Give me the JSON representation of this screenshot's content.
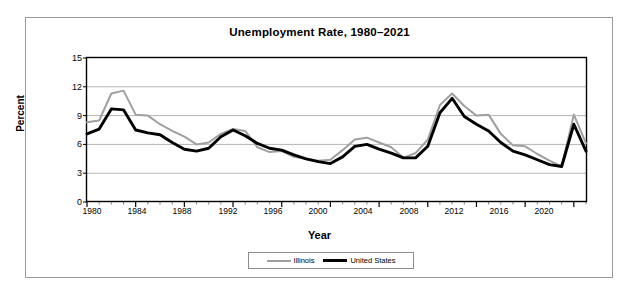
{
  "chart_data": {
    "type": "line",
    "title": "Unemployment Rate, 1980–2021",
    "xlabel": "Year",
    "ylabel": "Percent",
    "ylim": [
      0,
      15
    ],
    "xlim": [
      1980,
      2021
    ],
    "ytick_labels": [
      "15",
      "12",
      "9",
      "6",
      "3",
      "0"
    ],
    "yticks": [
      15,
      12,
      9,
      6,
      3,
      0
    ],
    "xtick_labels": [
      "1980",
      "1984",
      "1988",
      "1992",
      "1996",
      "2000",
      "2004",
      "2008",
      "2012",
      "2016",
      "2020"
    ],
    "xticks": [
      1980,
      1984,
      1988,
      1992,
      1996,
      2000,
      2004,
      2008,
      2012,
      2016,
      2020
    ],
    "grid": "horizontal",
    "legend_position": "bottom",
    "x": [
      1980,
      1981,
      1982,
      1983,
      1984,
      1985,
      1986,
      1987,
      1988,
      1989,
      1990,
      1991,
      1992,
      1993,
      1994,
      1995,
      1996,
      1997,
      1998,
      1999,
      2000,
      2001,
      2002,
      2003,
      2004,
      2005,
      2006,
      2007,
      2008,
      2009,
      2010,
      2011,
      2012,
      2013,
      2014,
      2015,
      2016,
      2017,
      2018,
      2019,
      2020,
      2021
    ],
    "series": [
      {
        "name": "Illinois",
        "color": "#a0a0a0",
        "line_width": 2,
        "values": [
          8.3,
          8.5,
          11.3,
          11.6,
          9.1,
          9.0,
          8.1,
          7.4,
          6.8,
          6.0,
          6.2,
          7.1,
          7.6,
          7.4,
          5.7,
          5.2,
          5.3,
          4.7,
          4.5,
          4.3,
          4.4,
          5.4,
          6.5,
          6.7,
          6.2,
          5.7,
          4.6,
          5.1,
          6.5,
          10.1,
          11.3,
          10.0,
          9.0,
          9.1,
          7.1,
          5.9,
          5.8,
          5.0,
          4.3,
          3.7,
          9.1,
          6.1
        ]
      },
      {
        "name": "United States",
        "color": "#000000",
        "line_width": 3,
        "values": [
          7.1,
          7.6,
          9.7,
          9.6,
          7.5,
          7.2,
          7.0,
          6.2,
          5.5,
          5.3,
          5.6,
          6.8,
          7.5,
          6.9,
          6.1,
          5.6,
          5.4,
          4.9,
          4.5,
          4.2,
          4.0,
          4.7,
          5.8,
          6.0,
          5.5,
          5.1,
          4.6,
          4.6,
          5.8,
          9.3,
          10.8,
          8.9,
          8.1,
          7.4,
          6.2,
          5.3,
          4.9,
          4.4,
          3.9,
          3.7,
          8.1,
          5.3
        ]
      }
    ]
  },
  "legend": {
    "illinois_label": "Illinois",
    "united_states_label": "United States"
  }
}
